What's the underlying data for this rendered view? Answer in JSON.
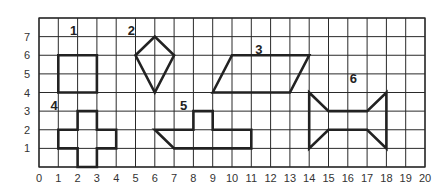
{
  "grid": {
    "x_min": 0,
    "x_max": 20,
    "y_min": 0,
    "y_max": 8,
    "x_ticks": [
      "0",
      "1",
      "2",
      "3",
      "4",
      "5",
      "6",
      "7",
      "8",
      "9",
      "10",
      "11",
      "12",
      "13",
      "14",
      "15",
      "16",
      "17",
      "18",
      "19",
      "20"
    ],
    "y_ticks": [
      "1",
      "2",
      "3",
      "4",
      "5",
      "6",
      "7"
    ],
    "line_color": "#2a2a2a",
    "shape_color": "#222222"
  },
  "shapes": [
    {
      "label": "1",
      "name": "square",
      "label_pos": [
        1.6,
        7.35
      ],
      "points": [
        [
          1,
          4
        ],
        [
          3,
          4
        ],
        [
          3,
          6
        ],
        [
          1,
          6
        ]
      ]
    },
    {
      "label": "2",
      "name": "kite",
      "label_pos": [
        4.6,
        7.35
      ],
      "points": [
        [
          5,
          6
        ],
        [
          6,
          7
        ],
        [
          7,
          6
        ],
        [
          6,
          4
        ]
      ]
    },
    {
      "label": "3",
      "name": "parallelogram",
      "label_pos": [
        11.2,
        6.35
      ],
      "points": [
        [
          9,
          4
        ],
        [
          10,
          6
        ],
        [
          14,
          6
        ],
        [
          13,
          4
        ]
      ]
    },
    {
      "label": "4",
      "name": "cross",
      "label_pos": [
        0.6,
        3.35
      ],
      "points": [
        [
          1,
          1
        ],
        [
          2,
          1
        ],
        [
          2,
          0
        ],
        [
          3,
          0
        ],
        [
          3,
          1
        ],
        [
          4,
          1
        ],
        [
          4,
          2
        ],
        [
          3,
          2
        ],
        [
          3,
          3
        ],
        [
          2,
          3
        ],
        [
          2,
          2
        ],
        [
          1,
          2
        ]
      ]
    },
    {
      "label": "5",
      "name": "l-shape",
      "label_pos": [
        7.3,
        3.35
      ],
      "points": [
        [
          6,
          2
        ],
        [
          7,
          1
        ],
        [
          11,
          1
        ],
        [
          11,
          2
        ],
        [
          9,
          2
        ],
        [
          9,
          3
        ],
        [
          8,
          3
        ],
        [
          8,
          2
        ]
      ]
    },
    {
      "label": "6",
      "name": "bowtie-hexagon",
      "label_pos": [
        16.1,
        4.8
      ],
      "points": [
        [
          14,
          4
        ],
        [
          15,
          3
        ],
        [
          17,
          3
        ],
        [
          18,
          4
        ],
        [
          18,
          1
        ],
        [
          17,
          2
        ],
        [
          15,
          2
        ],
        [
          14,
          1
        ]
      ]
    }
  ]
}
